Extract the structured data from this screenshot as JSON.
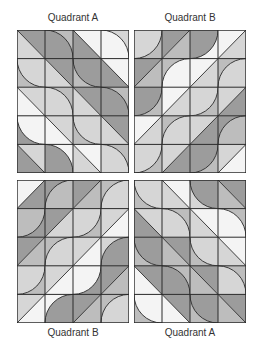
{
  "labels": {
    "top_left": "Quadrant A",
    "top_right": "Quadrant B",
    "bottom_left": "Quadrant B",
    "bottom_right": "Quadrant A"
  },
  "colors": {
    "white": "#f4f4f4",
    "light": "#d6d6d6",
    "mid": "#bdbdbd",
    "dark": "#9c9c9c",
    "line": "#2a2a2a"
  },
  "grid": {
    "cols": 4,
    "rows": 5
  },
  "quadrants": [
    {
      "id": "top_left",
      "cells": [
        [
          {
            "t": "d",
            "dir": "\\",
            "a": "dark",
            "b": "light"
          },
          {
            "t": "q",
            "c": "bl",
            "a": "dark",
            "b": "mid"
          },
          {
            "t": "d",
            "dir": "\\",
            "a": "white",
            "b": "dark"
          },
          {
            "t": "q",
            "c": "bl",
            "a": "white",
            "b": "light"
          }
        ],
        [
          {
            "t": "q",
            "c": "tr",
            "a": "light",
            "b": "mid"
          },
          {
            "t": "d",
            "dir": "\\",
            "a": "dark",
            "b": "light"
          },
          {
            "t": "q",
            "c": "tr",
            "a": "dark",
            "b": "mid"
          },
          {
            "t": "d",
            "dir": "\\",
            "a": "white",
            "b": "dark"
          }
        ],
        [
          {
            "t": "d",
            "dir": "\\",
            "a": "light",
            "b": "white"
          },
          {
            "t": "q",
            "c": "bl",
            "a": "light",
            "b": "mid"
          },
          {
            "t": "d",
            "dir": "\\",
            "a": "dark",
            "b": "light"
          },
          {
            "t": "q",
            "c": "bl",
            "a": "dark",
            "b": "mid"
          }
        ],
        [
          {
            "t": "q",
            "c": "tr",
            "a": "white",
            "b": "dark"
          },
          {
            "t": "d",
            "dir": "\\",
            "a": "light",
            "b": "white"
          },
          {
            "t": "q",
            "c": "tr",
            "a": "light",
            "b": "mid"
          },
          {
            "t": "d",
            "dir": "\\",
            "a": "dark",
            "b": "light"
          }
        ],
        [
          {
            "t": "d",
            "dir": "\\",
            "a": "light",
            "b": "dark"
          },
          {
            "t": "q",
            "c": "bl",
            "a": "dark",
            "b": "white"
          },
          {
            "t": "d",
            "dir": "\\",
            "a": "white",
            "b": "light"
          },
          {
            "t": "q",
            "c": "bl",
            "a": "light",
            "b": "mid"
          }
        ]
      ]
    },
    {
      "id": "top_right",
      "cells": [
        [
          {
            "t": "q",
            "c": "tl",
            "a": "light",
            "b": "mid"
          },
          {
            "t": "d",
            "dir": "/",
            "a": "dark",
            "b": "mid"
          },
          {
            "t": "q",
            "c": "tl",
            "a": "dark",
            "b": "white"
          },
          {
            "t": "d",
            "dir": "/",
            "a": "white",
            "b": "light"
          }
        ],
        [
          {
            "t": "d",
            "dir": "/",
            "a": "dark",
            "b": "mid"
          },
          {
            "t": "q",
            "c": "br",
            "a": "white",
            "b": "mid"
          },
          {
            "t": "d",
            "dir": "/",
            "a": "white",
            "b": "light"
          },
          {
            "t": "q",
            "c": "br",
            "a": "light",
            "b": "mid"
          }
        ],
        [
          {
            "t": "q",
            "c": "tl",
            "a": "dark",
            "b": "mid"
          },
          {
            "t": "d",
            "dir": "/",
            "a": "white",
            "b": "light"
          },
          {
            "t": "q",
            "c": "tl",
            "a": "light",
            "b": "mid"
          },
          {
            "t": "d",
            "dir": "/",
            "a": "light",
            "b": "dark"
          }
        ],
        [
          {
            "t": "d",
            "dir": "/",
            "a": "white",
            "b": "light"
          },
          {
            "t": "q",
            "c": "br",
            "a": "light",
            "b": "mid"
          },
          {
            "t": "d",
            "dir": "/",
            "a": "light",
            "b": "dark"
          },
          {
            "t": "q",
            "c": "br",
            "a": "mid",
            "b": "dark"
          }
        ],
        [
          {
            "t": "q",
            "c": "tl",
            "a": "light",
            "b": "mid"
          },
          {
            "t": "d",
            "dir": "/",
            "a": "light",
            "b": "dark"
          },
          {
            "t": "q",
            "c": "tl",
            "a": "dark",
            "b": "mid"
          },
          {
            "t": "d",
            "dir": "/",
            "a": "light",
            "b": "white"
          }
        ]
      ]
    },
    {
      "id": "bottom_left",
      "cells": [
        [
          {
            "t": "d",
            "dir": "/",
            "a": "white",
            "b": "dark"
          },
          {
            "t": "q",
            "c": "br",
            "a": "mid",
            "b": "dark"
          },
          {
            "t": "d",
            "dir": "/",
            "a": "dark",
            "b": "mid"
          },
          {
            "t": "q",
            "c": "br",
            "a": "light",
            "b": "mid"
          }
        ],
        [
          {
            "t": "q",
            "c": "tl",
            "a": "mid",
            "b": "dark"
          },
          {
            "t": "d",
            "dir": "/",
            "a": "dark",
            "b": "light"
          },
          {
            "t": "q",
            "c": "tl",
            "a": "light",
            "b": "mid"
          },
          {
            "t": "d",
            "dir": "/",
            "a": "light",
            "b": "white"
          }
        ],
        [
          {
            "t": "d",
            "dir": "/",
            "a": "dark",
            "b": "mid"
          },
          {
            "t": "q",
            "c": "br",
            "a": "light",
            "b": "mid"
          },
          {
            "t": "d",
            "dir": "/",
            "a": "light",
            "b": "white"
          },
          {
            "t": "q",
            "c": "br",
            "a": "dark",
            "b": "light"
          }
        ],
        [
          {
            "t": "q",
            "c": "tl",
            "a": "light",
            "b": "mid"
          },
          {
            "t": "d",
            "dir": "/",
            "a": "light",
            "b": "white"
          },
          {
            "t": "q",
            "c": "tl",
            "a": "white",
            "b": "dark"
          },
          {
            "t": "d",
            "dir": "/",
            "a": "dark",
            "b": "mid"
          }
        ],
        [
          {
            "t": "d",
            "dir": "/",
            "a": "light",
            "b": "white"
          },
          {
            "t": "q",
            "c": "br",
            "a": "dark",
            "b": "white"
          },
          {
            "t": "d",
            "dir": "/",
            "a": "dark",
            "b": "mid"
          },
          {
            "t": "q",
            "c": "br",
            "a": "light",
            "b": "mid"
          }
        ]
      ]
    },
    {
      "id": "bottom_right",
      "cells": [
        [
          {
            "t": "q",
            "c": "tr",
            "a": "light",
            "b": "mid"
          },
          {
            "t": "d",
            "dir": "\\",
            "a": "white",
            "b": "light"
          },
          {
            "t": "q",
            "c": "tr",
            "a": "dark",
            "b": "light"
          },
          {
            "t": "d",
            "dir": "\\",
            "a": "dark",
            "b": "mid"
          }
        ],
        [
          {
            "t": "d",
            "dir": "\\",
            "a": "light",
            "b": "dark"
          },
          {
            "t": "q",
            "c": "bl",
            "a": "light",
            "b": "mid"
          },
          {
            "t": "d",
            "dir": "\\",
            "a": "white",
            "b": "light"
          },
          {
            "t": "q",
            "c": "bl",
            "a": "white",
            "b": "mid"
          }
        ],
        [
          {
            "t": "q",
            "c": "tr",
            "a": "dark",
            "b": "mid"
          },
          {
            "t": "d",
            "dir": "\\",
            "a": "dark",
            "b": "mid"
          },
          {
            "t": "q",
            "c": "tr",
            "a": "light",
            "b": "mid"
          },
          {
            "t": "d",
            "dir": "\\",
            "a": "white",
            "b": "light"
          }
        ],
        [
          {
            "t": "d",
            "dir": "\\",
            "a": "dark",
            "b": "white"
          },
          {
            "t": "q",
            "c": "bl",
            "a": "dark",
            "b": "mid"
          },
          {
            "t": "d",
            "dir": "\\",
            "a": "dark",
            "b": "mid"
          },
          {
            "t": "q",
            "c": "bl",
            "a": "light",
            "b": "mid"
          }
        ],
        [
          {
            "t": "q",
            "c": "tr",
            "a": "white",
            "b": "mid"
          },
          {
            "t": "d",
            "dir": "\\",
            "a": "dark",
            "b": "white"
          },
          {
            "t": "q",
            "c": "tr",
            "a": "dark",
            "b": "mid"
          },
          {
            "t": "d",
            "dir": "\\",
            "a": "dark",
            "b": "mid"
          }
        ]
      ]
    }
  ]
}
